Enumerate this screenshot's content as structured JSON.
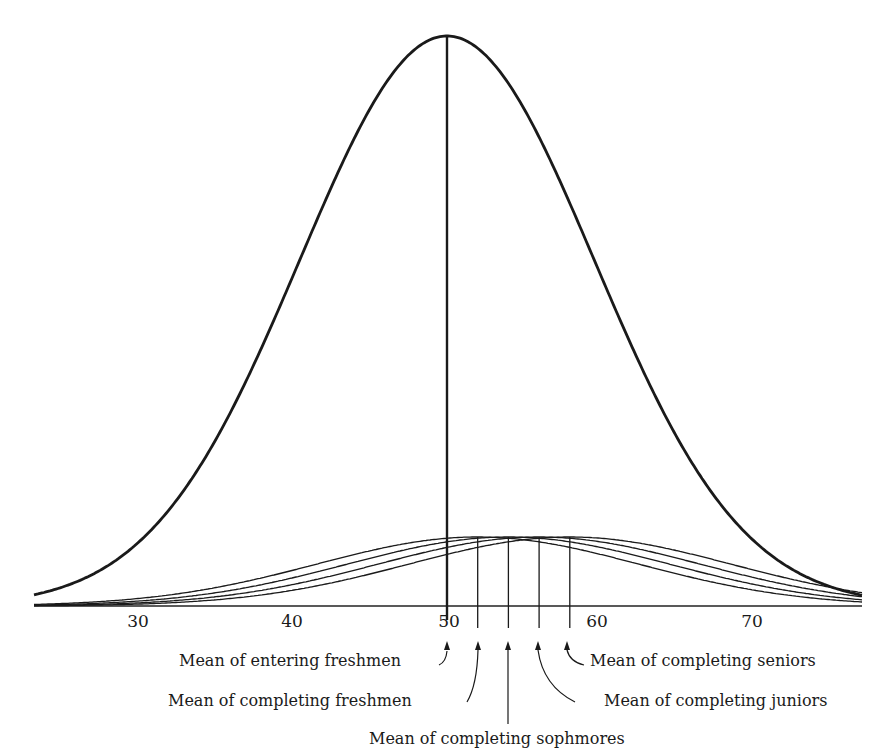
{
  "chart_data": {
    "type": "line",
    "title": "",
    "xlabel": "",
    "ylabel": "",
    "xlim": [
      23,
      77
    ],
    "x_ticks": [
      30,
      40,
      50,
      60,
      70
    ],
    "tick_labels": [
      "30",
      "40",
      "50",
      "60",
      "70"
    ],
    "grid": false,
    "legend": "none",
    "series": [
      {
        "name": "Entering freshmen",
        "mean": 50,
        "sd": 10,
        "relative_height": 1.0,
        "stroke": "thick"
      },
      {
        "name": "Completing freshmen",
        "mean": 52,
        "sd": 10,
        "relative_height": 0.12
      },
      {
        "name": "Completing sophmores",
        "mean": 54,
        "sd": 10,
        "relative_height": 0.12
      },
      {
        "name": "Completing juniors",
        "mean": 56,
        "sd": 10,
        "relative_height": 0.12
      },
      {
        "name": "Completing seniors",
        "mean": 58,
        "sd": 10,
        "relative_height": 0.12
      }
    ],
    "annotations": [
      {
        "text": "Mean of entering freshmen",
        "x": 50
      },
      {
        "text": "Mean of completing freshmen",
        "x": 52
      },
      {
        "text": "Mean of completing sophmores",
        "x": 54
      },
      {
        "text": "Mean of completing juniors",
        "x": 56
      },
      {
        "text": "Mean of completing seniors",
        "x": 58
      }
    ]
  },
  "labels": {
    "entering_freshmen": "Mean of entering freshmen",
    "completing_freshmen": "Mean of completing freshmen",
    "completing_sophmores": "Mean of completing sophmores",
    "completing_juniors": "Mean of completing juniors",
    "completing_seniors": "Mean of completing seniors"
  }
}
